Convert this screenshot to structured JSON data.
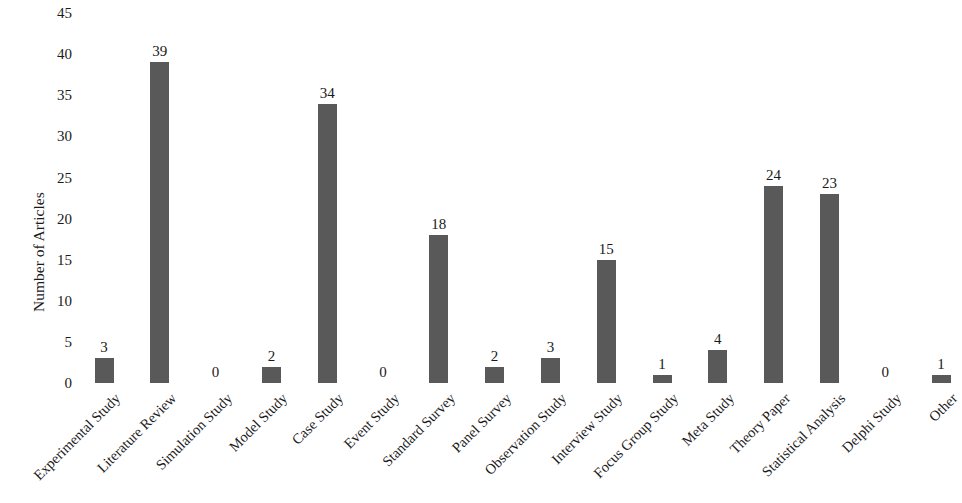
{
  "chart_data": {
    "type": "bar",
    "title": "",
    "xlabel": "",
    "ylabel": "Number of Articles",
    "ylim": [
      0,
      45
    ],
    "ytick_step": 5,
    "yticks": [
      "45",
      "40",
      "35",
      "30",
      "25",
      "20",
      "15",
      "10",
      "5",
      "0"
    ],
    "grid": false,
    "legend": null,
    "bar_color": "#595959",
    "value_labels_shown": true,
    "categories": [
      "Experimental Study",
      "Literature Review",
      "Simulation Study",
      "Model Study",
      "Case Study",
      "Event Study",
      "Standard Survey",
      "Panel Survey",
      "Observation Study",
      "Interview Study",
      "Focus Group Study",
      "Meta Study",
      "Theory Paper",
      "Statistical Analysis",
      "Delphi Study",
      "Other"
    ],
    "values": [
      3,
      39,
      0,
      2,
      34,
      0,
      18,
      2,
      3,
      15,
      1,
      4,
      24,
      23,
      0,
      1
    ],
    "value_labels": [
      "3",
      "39",
      "0",
      "2",
      "34",
      "0",
      "18",
      "2",
      "3",
      "15",
      "1",
      "4",
      "24",
      "23",
      "0",
      "1"
    ]
  }
}
